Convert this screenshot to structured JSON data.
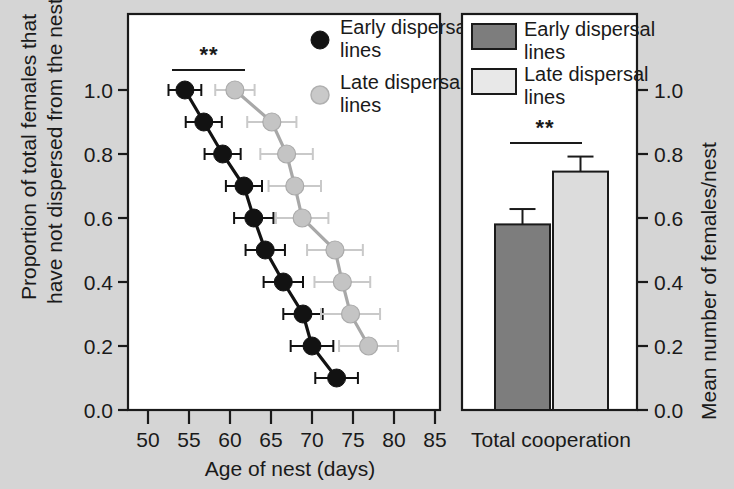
{
  "figure": {
    "background_color": "#d5d5d5",
    "panel_background": "#ffffff",
    "accent_dark": "#121212",
    "accent_light": "#c4c4c4"
  },
  "left_panel": {
    "ylabel_line1": "Proportion of total females that",
    "ylabel_line2": "have not dispersed from the nest",
    "xlabel": "Age of nest (days)",
    "significance_marker": "**",
    "legend": [
      {
        "marker": "filled-circle",
        "label_line1": "Early dispersal",
        "label_line2": "lines"
      },
      {
        "marker": "open-circle",
        "label_line1": "Late dispersal",
        "label_line2": "lines"
      }
    ]
  },
  "right_panel": {
    "ylabel": "Mean number of females/nest",
    "xlabel": "Total cooperation",
    "significance_marker": "**",
    "legend": [
      {
        "marker": "dark-swatch",
        "label_line1": "Early dispersal",
        "label_line2": "lines"
      },
      {
        "marker": "light-swatch",
        "label_line1": "Late dispersal",
        "label_line2": "lines"
      }
    ]
  },
  "chart_data": [
    {
      "type": "line",
      "title": "",
      "xlabel": "Age of nest (days)",
      "ylabel": "Proportion of total females that have not dispersed from the nest",
      "xlim": [
        48,
        87
      ],
      "ylim": [
        0.0,
        1.08
      ],
      "xticks": [
        50,
        55,
        60,
        65,
        70,
        75,
        80,
        85
      ],
      "yticks": [
        "0.0",
        "0.2",
        "0.4",
        "0.6",
        "0.8",
        "1.0"
      ],
      "grid": false,
      "legend_position": "top-right",
      "annotations": [
        {
          "text": "**",
          "x_start": 55.5,
          "x_end": 64.0,
          "y": 1.06
        }
      ],
      "series": [
        {
          "name": "Early dispersal lines",
          "color": "#121212",
          "marker": "filled-circle",
          "points": [
            {
              "x": 54.5,
              "y": 1.0,
              "xerr": 2.0
            },
            {
              "x": 56.8,
              "y": 0.9,
              "xerr": 2.2
            },
            {
              "x": 59.1,
              "y": 0.8,
              "xerr": 2.2
            },
            {
              "x": 61.7,
              "y": 0.7,
              "xerr": 2.2
            },
            {
              "x": 62.9,
              "y": 0.6,
              "xerr": 2.4
            },
            {
              "x": 64.3,
              "y": 0.5,
              "xerr": 2.4
            },
            {
              "x": 66.5,
              "y": 0.4,
              "xerr": 2.4
            },
            {
              "x": 68.9,
              "y": 0.3,
              "xerr": 2.4
            },
            {
              "x": 70.0,
              "y": 0.2,
              "xerr": 2.6
            },
            {
              "x": 73.0,
              "y": 0.1,
              "xerr": 2.6
            }
          ]
        },
        {
          "name": "Late dispersal lines",
          "color": "#c4c4c4",
          "marker": "open-circle",
          "points": [
            {
              "x": 60.6,
              "y": 1.0,
              "xerr": 2.4
            },
            {
              "x": 65.1,
              "y": 0.9,
              "xerr": 3.0
            },
            {
              "x": 66.9,
              "y": 0.8,
              "xerr": 3.2
            },
            {
              "x": 67.9,
              "y": 0.7,
              "xerr": 3.2
            },
            {
              "x": 68.8,
              "y": 0.6,
              "xerr": 3.2
            },
            {
              "x": 72.8,
              "y": 0.5,
              "xerr": 3.4
            },
            {
              "x": 73.7,
              "y": 0.4,
              "xerr": 3.4
            },
            {
              "x": 74.7,
              "y": 0.3,
              "xerr": 3.6
            },
            {
              "x": 76.9,
              "y": 0.2,
              "xerr": 3.6
            }
          ]
        }
      ]
    },
    {
      "type": "bar",
      "title": "",
      "xlabel": "Total cooperation",
      "ylabel": "Mean number of females/nest",
      "ylim": [
        0.0,
        1.08
      ],
      "yticks": [
        "0.0",
        "0.2",
        "0.4",
        "0.6",
        "0.8",
        "1.0"
      ],
      "grid": false,
      "legend_position": "top-left",
      "categories": [
        "Early dispersal lines",
        "Late dispersal lines"
      ],
      "values": [
        0.58,
        0.745
      ],
      "errors": [
        0.048,
        0.047
      ],
      "colors": [
        "#7d7d7d",
        "#dcdcdc"
      ],
      "annotations": [
        {
          "text": "**",
          "y": 0.93
        }
      ]
    }
  ]
}
